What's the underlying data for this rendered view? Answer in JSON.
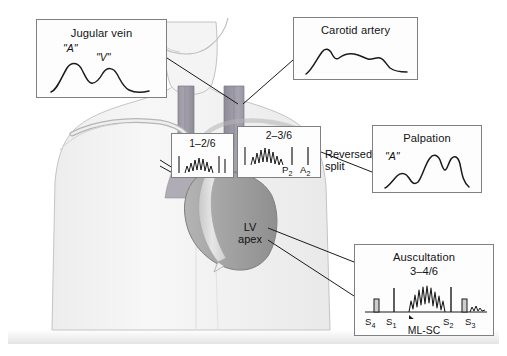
{
  "figure": {
    "background_color": "#ffffff",
    "panel_border_color": "#7f8084",
    "body_fill": "#f2f2f2",
    "heart_fill": "#9a9a9a",
    "septum_fill": "#d8d8d8",
    "vessel_fill": "#9d9aa6"
  },
  "panels": {
    "jugular": {
      "title": "Jugular vein",
      "wave_labels": {
        "a_wave": "\"A\"",
        "v_wave": "\"V\""
      },
      "waveform": "jvp-a-v-wave"
    },
    "carotid": {
      "title": "Carotid artery",
      "waveform": "carotid-bisferiens-spike-dome"
    },
    "palpation": {
      "title": "Palpation",
      "wave_labels": {
        "a_wave": "\"A\""
      },
      "waveform": "apical-triple-impulse"
    },
    "auscultation": {
      "title": "Auscultation",
      "grade": "3–4/6",
      "location": "ML-SC",
      "sounds": [
        "S",
        "S",
        "S",
        "S"
      ],
      "sound_labels": {
        "s4": "S",
        "s1": "S",
        "s2": "S",
        "s3": "S"
      },
      "subscripts": {
        "s4": "4",
        "s1": "1",
        "s2": "2",
        "s3": "3"
      },
      "waveform": "phonocardiogram-diamond-systolic-murmur"
    },
    "murmur_left": {
      "grade": "1–2/6",
      "waveform": "murmur-spindle"
    },
    "murmur_right": {
      "grade": "2–3/6",
      "waveform": "murmur-spindle",
      "components": {
        "p2": "P",
        "p2_sub": "2",
        "a2": "A",
        "a2_sub": "2"
      }
    }
  },
  "annotations": {
    "reversed_split": "Reversed\nsplit",
    "reversed_split_line1": "Reversed",
    "reversed_split_line2": "split",
    "lv_apex_line1": "LV",
    "lv_apex_line2": "apex"
  }
}
